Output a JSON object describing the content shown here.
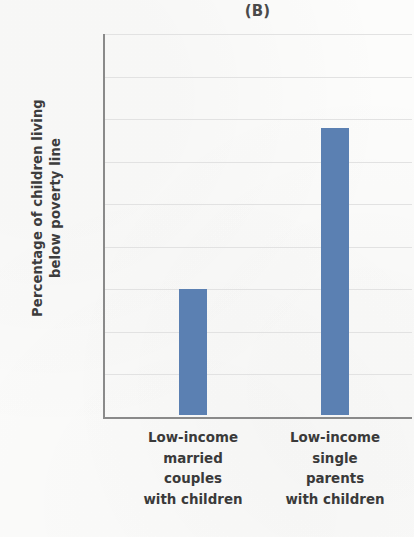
{
  "chart_data": {
    "type": "bar",
    "title": "(B)",
    "xlabel": "",
    "ylabel": "Percentage of children living below poverty line",
    "ylabel_lines": [
      "Percentage of children living",
      "below poverty line"
    ],
    "categories": [
      "Low-income married couples with children",
      "Low-income single parents with children"
    ],
    "category_label_lines": [
      [
        "Low-income",
        "married",
        "couples",
        "with children"
      ],
      [
        "Low-income",
        "single",
        "parents",
        "with children"
      ]
    ],
    "values": [
      29.5,
      67.5
    ],
    "ylim": [
      0,
      90
    ],
    "yticks": [
      90,
      80,
      70,
      60,
      50,
      40,
      30,
      20,
      10
    ],
    "ytick_labels": [
      "90",
      "80",
      "70",
      "60",
      "50",
      "40",
      "30",
      "20",
      "10"
    ],
    "grid": true,
    "legend": null,
    "bar_color": "#5b80b2",
    "axis_color": "#8a8a8a",
    "grid_color": "#e2e2e2",
    "background_color": "#fcfcfb"
  }
}
